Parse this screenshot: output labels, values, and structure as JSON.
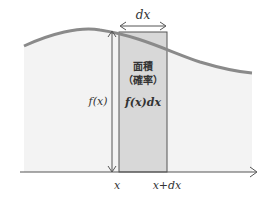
{
  "diagram": {
    "width_label": "dx",
    "height_label": "f(x)",
    "area_title_line1": "面積",
    "area_title_line2": "（確率）",
    "area_formula": "f(x)dx",
    "x_label": "x",
    "x_dx_label": "x+dx",
    "colors": {
      "curve": "#8a8a8a",
      "area_fill": "#f2f2f2",
      "strip_fill": "#d9d9d9",
      "lines": "#555555"
    }
  }
}
